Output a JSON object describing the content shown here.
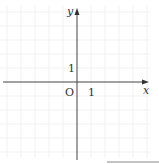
{
  "diagram": {
    "type": "coordinate-plane",
    "x_axis_label": "x",
    "y_axis_label": "y",
    "origin_label": "O",
    "x_tick_label": "1",
    "y_tick_label": "1",
    "grid": "faint unit grid",
    "colors": {
      "axis": "#444444",
      "grid": "#f0f0f0",
      "text": "#333333"
    }
  }
}
